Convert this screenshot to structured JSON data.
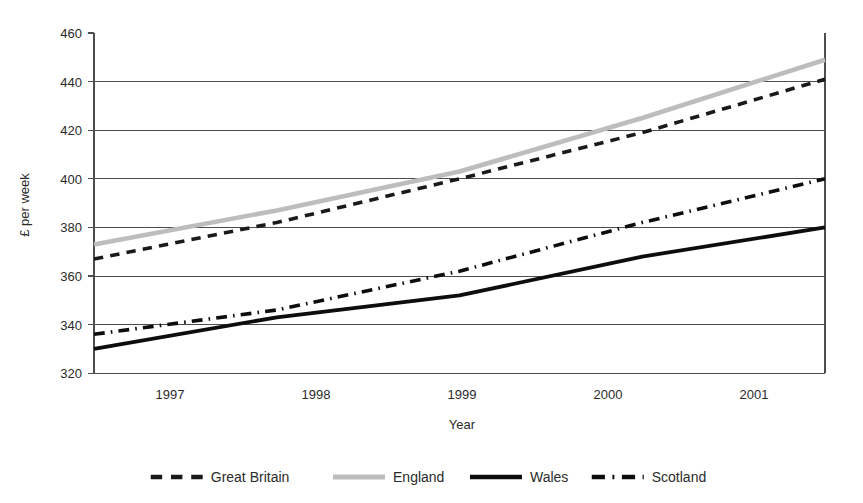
{
  "chart_data": {
    "type": "line",
    "title": "",
    "xlabel": "Year",
    "ylabel": "£ per week",
    "x": [
      1997,
      1998,
      1999,
      2000,
      2001
    ],
    "categories": [
      "1997",
      "1998",
      "1999",
      "2000",
      "2001"
    ],
    "xlim": [
      1997,
      2001
    ],
    "ylim": [
      320,
      460
    ],
    "yticks": [
      320,
      340,
      360,
      380,
      400,
      420,
      440,
      460
    ],
    "ytick_labels": [
      "320",
      "340",
      "360",
      "380",
      "400",
      "420",
      "440",
      "460"
    ],
    "grid": "horizontal",
    "legend_position": "bottom",
    "series": [
      {
        "name": "Great Britain",
        "values": [
          367,
          382,
          400,
          419,
          441
        ],
        "color": "#1a1a1a",
        "style": "dashed"
      },
      {
        "name": "England",
        "values": [
          373,
          387,
          403,
          425,
          449
        ],
        "color": "#bdbdbd",
        "style": "solid"
      },
      {
        "name": "Wales",
        "values": [
          330,
          343,
          352,
          368,
          380
        ],
        "color": "#0d0d0d",
        "style": "solid"
      },
      {
        "name": "Scotland",
        "values": [
          336,
          346,
          362,
          382,
          400
        ],
        "color": "#0d0d0d",
        "style": "dashdot"
      }
    ]
  },
  "axes": {
    "y_title": "£ per week",
    "x_title": "Year",
    "y_tick_0": "320",
    "y_tick_1": "340",
    "y_tick_2": "360",
    "y_tick_3": "380",
    "y_tick_4": "400",
    "y_tick_5": "420",
    "y_tick_6": "440",
    "y_tick_7": "460",
    "x_tick_0": "1997",
    "x_tick_1": "1998",
    "x_tick_2": "1999",
    "x_tick_3": "2000",
    "x_tick_4": "2001"
  },
  "legend": {
    "items": [
      {
        "label": "Great Britain",
        "color": "#1a1a1a",
        "style": "dashed"
      },
      {
        "label": "England",
        "color": "#bdbdbd",
        "style": "solid"
      },
      {
        "label": "Wales",
        "color": "#0d0d0d",
        "style": "solid"
      },
      {
        "label": "Scotland",
        "color": "#0d0d0d",
        "style": "dashdot"
      }
    ],
    "item_0_label": "Great Britain",
    "item_1_label": "England",
    "item_2_label": "Wales",
    "item_3_label": "Scotland"
  },
  "colors": {
    "great_britain": "#1a1a1a",
    "england": "#bdbdbd",
    "wales": "#0d0d0d",
    "scotland": "#0d0d0d",
    "grid": "#4d4d4d",
    "text": "#2b2b2b",
    "background": "#ffffff"
  }
}
